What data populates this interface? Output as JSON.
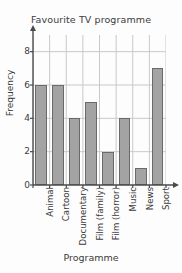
{
  "chart_data": {
    "type": "bar",
    "title": "Favourite TV programme",
    "xlabel": "Programme",
    "ylabel": "Frequency",
    "categories": [
      "Animal",
      "Cartoon",
      "Documentary",
      "Film (family)",
      "Film (horror)",
      "Music",
      "News",
      "Sport"
    ],
    "values": [
      6,
      6,
      4,
      5,
      2,
      4,
      1,
      7
    ],
    "ylim": [
      0,
      9
    ],
    "y_ticks": [
      0,
      2,
      4,
      6,
      8
    ],
    "y_tick_labels": [
      "0",
      "2",
      "4",
      "6",
      "8"
    ],
    "grid": true,
    "legend": false,
    "colors": {
      "bar_fill": "#a3a3a3",
      "bar_border": "#6a6a6a",
      "grid_line": "#c9c9c9",
      "axis_line": "#4a4a4a",
      "text": "#3b3b3b",
      "background": "#fdfdfd"
    }
  }
}
